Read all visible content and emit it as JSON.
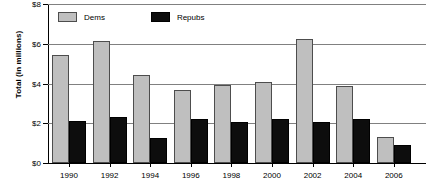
{
  "chart_data": {
    "type": "bar",
    "title": "",
    "subtitle": "",
    "xlabel": "",
    "ylabel": "Total (in millions)",
    "categories": [
      "1990",
      "1992",
      "1994",
      "1996",
      "1998",
      "2000",
      "2002",
      "2004",
      "2006"
    ],
    "series": [
      {
        "name": "Dems",
        "color": "#bfbfbf",
        "values": [
          5.45,
          6.15,
          4.45,
          3.65,
          3.95,
          4.1,
          6.25,
          3.85,
          1.3
        ]
      },
      {
        "name": "Repubs",
        "color": "#0d0d0d",
        "values": [
          2.1,
          2.3,
          1.25,
          2.2,
          2.05,
          2.2,
          2.05,
          2.2,
          0.9
        ]
      }
    ],
    "ylim": [
      0,
      8
    ],
    "ytick_values": [
      0,
      2,
      4,
      6,
      8
    ],
    "ytick_labels": [
      "$0",
      "$2",
      "$4",
      "$6",
      "$8"
    ],
    "grid": true,
    "grid_axis": "y",
    "legend_position": "top-left-inside",
    "legend_entries": [
      "Dems",
      "Repubs"
    ]
  }
}
